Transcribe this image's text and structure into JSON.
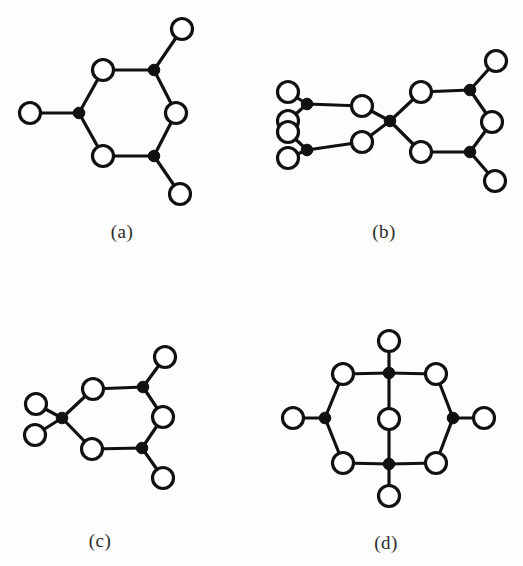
{
  "figure": {
    "background_color": "#fdfdfd",
    "ink_color": "#111111",
    "open_node_fill": "#ffffff",
    "width": 523,
    "height": 566
  },
  "labels": {
    "a": "(a)",
    "b": "(b)",
    "c": "(c)",
    "d": "(d)"
  },
  "label_positions": {
    "a": {
      "x": 122,
      "y": 232
    },
    "b": {
      "x": 384,
      "y": 232
    },
    "c": {
      "x": 100,
      "y": 541
    },
    "d": {
      "x": 386,
      "y": 543
    }
  },
  "geometry": {
    "open_radius": 10.5,
    "filled_radius": 5.8
  },
  "panels": [
    {
      "id": "a",
      "label": "(a)",
      "node_counts": {
        "filled": 3,
        "open": 6
      },
      "nodes": [
        {
          "id": "a_o_top",
          "type": "open",
          "x": 103,
          "y": 70
        },
        {
          "id": "a_f_topright",
          "type": "filled",
          "x": 154,
          "y": 70
        },
        {
          "id": "a_o_right",
          "type": "open",
          "x": 176,
          "y": 113
        },
        {
          "id": "a_f_botright",
          "type": "filled",
          "x": 154,
          "y": 156
        },
        {
          "id": "a_o_bottom",
          "type": "open",
          "x": 103,
          "y": 156
        },
        {
          "id": "a_f_left",
          "type": "filled",
          "x": 79,
          "y": 113
        },
        {
          "id": "a_o_pend_topright",
          "type": "open",
          "x": 182,
          "y": 29
        },
        {
          "id": "a_o_pend_botright",
          "type": "open",
          "x": 180,
          "y": 194
        },
        {
          "id": "a_o_pend_left",
          "type": "open",
          "x": 30,
          "y": 113
        }
      ],
      "bonds": [
        [
          "a_o_top",
          "a_f_topright"
        ],
        [
          "a_f_topright",
          "a_o_right"
        ],
        [
          "a_o_right",
          "a_f_botright"
        ],
        [
          "a_f_botright",
          "a_o_bottom"
        ],
        [
          "a_o_bottom",
          "a_f_left"
        ],
        [
          "a_f_left",
          "a_o_top"
        ],
        [
          "a_f_topright",
          "a_o_pend_topright"
        ],
        [
          "a_f_botright",
          "a_o_pend_botright"
        ],
        [
          "a_f_left",
          "a_o_pend_left"
        ]
      ]
    },
    {
      "id": "b",
      "label": "(b)",
      "node_counts": {
        "filled": 6,
        "open": 10
      },
      "nodes": [
        {
          "id": "b_o_top",
          "type": "open",
          "x": 421,
          "y": 92
        },
        {
          "id": "b_f_topright",
          "type": "filled",
          "x": 470,
          "y": 90
        },
        {
          "id": "b_o_right",
          "type": "open",
          "x": 492,
          "y": 122
        },
        {
          "id": "b_f_botright",
          "type": "filled",
          "x": 470,
          "y": 152
        },
        {
          "id": "b_o_bottom",
          "type": "open",
          "x": 421,
          "y": 152
        },
        {
          "id": "b_f_center",
          "type": "filled",
          "x": 390,
          "y": 121
        },
        {
          "id": "b_o_pend_topright",
          "type": "open",
          "x": 496,
          "y": 61
        },
        {
          "id": "b_o_pend_botright",
          "type": "open",
          "x": 495,
          "y": 181
        },
        {
          "id": "b_o_mid_upper",
          "type": "open",
          "x": 362,
          "y": 106
        },
        {
          "id": "b_o_mid_lower",
          "type": "open",
          "x": 362,
          "y": 142
        },
        {
          "id": "b_f_left_upper",
          "type": "filled",
          "x": 307,
          "y": 104
        },
        {
          "id": "b_f_left_lower",
          "type": "filled",
          "x": 307,
          "y": 150
        },
        {
          "id": "b_o_end_a",
          "type": "open",
          "x": 288,
          "y": 92
        },
        {
          "id": "b_o_end_b",
          "type": "open",
          "x": 288,
          "y": 121
        },
        {
          "id": "b_o_end_c",
          "type": "open",
          "x": 288,
          "y": 132
        },
        {
          "id": "b_o_end_d",
          "type": "open",
          "x": 288,
          "y": 158
        }
      ],
      "bonds": [
        [
          "b_o_top",
          "b_f_topright"
        ],
        [
          "b_f_topright",
          "b_o_right"
        ],
        [
          "b_o_right",
          "b_f_botright"
        ],
        [
          "b_f_botright",
          "b_o_bottom"
        ],
        [
          "b_o_bottom",
          "b_f_center"
        ],
        [
          "b_f_center",
          "b_o_top"
        ],
        [
          "b_f_topright",
          "b_o_pend_topright"
        ],
        [
          "b_f_botright",
          "b_o_pend_botright"
        ],
        [
          "b_f_center",
          "b_o_mid_upper"
        ],
        [
          "b_f_center",
          "b_o_mid_lower"
        ],
        [
          "b_o_mid_upper",
          "b_f_left_upper"
        ],
        [
          "b_o_mid_lower",
          "b_f_left_lower"
        ],
        [
          "b_f_left_upper",
          "b_o_end_a"
        ],
        [
          "b_f_left_upper",
          "b_o_end_b"
        ],
        [
          "b_f_left_lower",
          "b_o_end_c"
        ],
        [
          "b_f_left_lower",
          "b_o_end_d"
        ]
      ]
    },
    {
      "id": "c",
      "label": "(c)",
      "node_counts": {
        "filled": 3,
        "open": 7
      },
      "nodes": [
        {
          "id": "c_o_top",
          "type": "open",
          "x": 93,
          "y": 389
        },
        {
          "id": "c_f_topright",
          "type": "filled",
          "x": 143,
          "y": 387
        },
        {
          "id": "c_o_right",
          "type": "open",
          "x": 163,
          "y": 417
        },
        {
          "id": "c_f_botright",
          "type": "filled",
          "x": 142,
          "y": 448
        },
        {
          "id": "c_o_bottom",
          "type": "open",
          "x": 92,
          "y": 449
        },
        {
          "id": "c_f_left",
          "type": "filled",
          "x": 62,
          "y": 418
        },
        {
          "id": "c_o_pend_topright",
          "type": "open",
          "x": 165,
          "y": 357
        },
        {
          "id": "c_o_pend_botright",
          "type": "open",
          "x": 163,
          "y": 478
        },
        {
          "id": "c_o_pend_upperleft",
          "type": "open",
          "x": 36,
          "y": 404
        },
        {
          "id": "c_o_pend_lowerleft",
          "type": "open",
          "x": 35,
          "y": 435
        }
      ],
      "bonds": [
        [
          "c_o_top",
          "c_f_topright"
        ],
        [
          "c_f_topright",
          "c_o_right"
        ],
        [
          "c_o_right",
          "c_f_botright"
        ],
        [
          "c_f_botright",
          "c_o_bottom"
        ],
        [
          "c_o_bottom",
          "c_f_left"
        ],
        [
          "c_f_left",
          "c_o_top"
        ],
        [
          "c_f_topright",
          "c_o_pend_topright"
        ],
        [
          "c_f_botright",
          "c_o_pend_botright"
        ],
        [
          "c_f_left",
          "c_o_pend_upperleft"
        ],
        [
          "c_f_left",
          "c_o_pend_lowerleft"
        ]
      ]
    },
    {
      "id": "d",
      "label": "(d)",
      "node_counts": {
        "filled": 4,
        "open": 9
      },
      "nodes": [
        {
          "id": "d_f_top",
          "type": "filled",
          "x": 389,
          "y": 373
        },
        {
          "id": "d_f_bottom",
          "type": "filled",
          "x": 389,
          "y": 464
        },
        {
          "id": "d_o_center",
          "type": "open",
          "x": 389,
          "y": 419
        },
        {
          "id": "d_o_upperleft",
          "type": "open",
          "x": 343,
          "y": 374
        },
        {
          "id": "d_o_upperright",
          "type": "open",
          "x": 436,
          "y": 374
        },
        {
          "id": "d_o_lowerleft",
          "type": "open",
          "x": 343,
          "y": 463
        },
        {
          "id": "d_o_lowerright",
          "type": "open",
          "x": 436,
          "y": 463
        },
        {
          "id": "d_f_left",
          "type": "filled",
          "x": 325,
          "y": 418
        },
        {
          "id": "d_f_right",
          "type": "filled",
          "x": 453,
          "y": 418
        },
        {
          "id": "d_o_pend_top",
          "type": "open",
          "x": 389,
          "y": 341
        },
        {
          "id": "d_o_pend_bottom",
          "type": "open",
          "x": 389,
          "y": 496
        },
        {
          "id": "d_o_pend_left",
          "type": "open",
          "x": 293,
          "y": 418
        },
        {
          "id": "d_o_pend_right",
          "type": "open",
          "x": 484,
          "y": 418
        }
      ],
      "bonds": [
        [
          "d_f_top",
          "d_o_upperleft"
        ],
        [
          "d_f_top",
          "d_o_upperright"
        ],
        [
          "d_o_upperleft",
          "d_f_left"
        ],
        [
          "d_o_upperright",
          "d_f_right"
        ],
        [
          "d_f_left",
          "d_o_lowerleft"
        ],
        [
          "d_f_right",
          "d_o_lowerright"
        ],
        [
          "d_o_lowerleft",
          "d_f_bottom"
        ],
        [
          "d_o_lowerright",
          "d_f_bottom"
        ],
        [
          "d_f_top",
          "d_o_center"
        ],
        [
          "d_o_center",
          "d_f_bottom"
        ],
        [
          "d_f_top",
          "d_o_pend_top"
        ],
        [
          "d_f_bottom",
          "d_o_pend_bottom"
        ],
        [
          "d_f_left",
          "d_o_pend_left"
        ],
        [
          "d_f_right",
          "d_o_pend_right"
        ]
      ]
    }
  ]
}
